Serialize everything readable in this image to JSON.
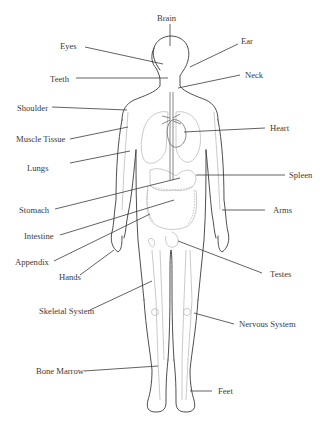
{
  "diagram": {
    "type": "anatomical-body-labels",
    "labels": {
      "brain": "Brain",
      "eyes": "Eyes",
      "ear": "Ear",
      "teeth": "Teeth",
      "neck": "Neck",
      "shoulder": "Shoulder",
      "muscle_tissue": "Muscle Tissue",
      "heart": "Heart",
      "lungs": "Lungs",
      "spleen": "Spleen",
      "stomach": "Stomach",
      "arms": "Arms",
      "intestine": "Intestine",
      "appendix": "Appendix",
      "hands": "Hands",
      "testes": "Testes",
      "skeletal_system": "Skeletal System",
      "nervous_system": "Nervous System",
      "bone_marrow": "Bone Marrow",
      "feet": "Feet"
    },
    "colors": {
      "outline": "#3a3a3a",
      "organs": "#bdbdbd",
      "background": "#ffffff"
    }
  }
}
